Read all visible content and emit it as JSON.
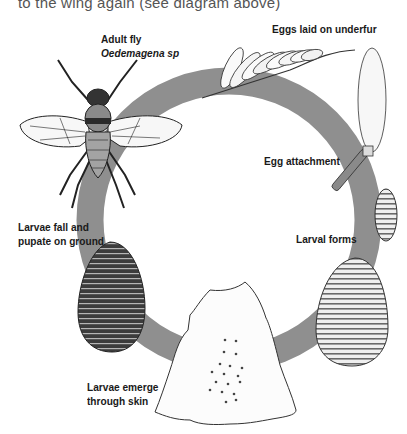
{
  "caption": {
    "top_text": "to the wing again (see diagram above)"
  },
  "diagram": {
    "ring_color": "#8f8f8f",
    "stages": [
      {
        "id": "adult",
        "label_line1": "Adult fly",
        "label_line2": "Oedemagena sp"
      },
      {
        "id": "eggs",
        "label_line1": "Eggs laid on underfur"
      },
      {
        "id": "attachment",
        "label_line1": "Egg attachment"
      },
      {
        "id": "larval",
        "label_line1": "Larval forms"
      },
      {
        "id": "emerge",
        "label_line1": "Larvae emerge",
        "label_line2": "through skin"
      },
      {
        "id": "pupate",
        "label_line1": "Larvae fall and",
        "label_line2": "pupate on ground"
      }
    ]
  }
}
